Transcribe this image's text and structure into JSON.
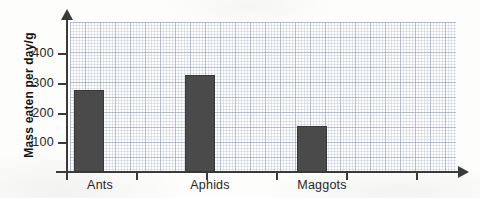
{
  "chart_data": {
    "type": "bar",
    "title": "",
    "xlabel": "",
    "ylabel": "Mass eaten per day/g",
    "categories": [
      "Ants",
      "Aphids",
      "Maggots"
    ],
    "values": [
      275,
      325,
      155
    ],
    "ylim": [
      0,
      500
    ],
    "yticks": [
      100,
      200,
      300,
      400
    ],
    "ytick_labels": [
      "100",
      "200",
      "300",
      "400"
    ],
    "grid": true,
    "legend": "none",
    "bar_color": "#4a4a4a",
    "axis_color": "#3a3a3a",
    "background_color": "#fdfdfb",
    "bars": [
      {
        "category": "Ants",
        "value": 275
      },
      {
        "category": "Aphids",
        "value": 325
      },
      {
        "category": "Maggots",
        "value": 155
      }
    ]
  }
}
